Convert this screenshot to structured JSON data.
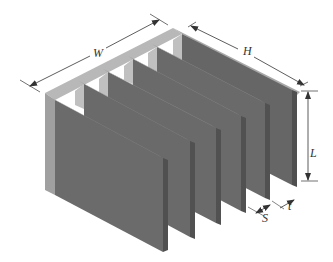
{
  "figure": {
    "fin_count": 6,
    "colors": {
      "fin_face": "#6b6b6b",
      "fin_edge": "#8a8a8a",
      "fin_side": "#555555",
      "plate_top": "#b5b5b5",
      "plate_side": "#9e9e9e",
      "dimension_line": "#333333"
    },
    "dimensions": {
      "width": "W",
      "height": "H",
      "length": "L",
      "thickness": "t",
      "spacing": "S"
    }
  }
}
